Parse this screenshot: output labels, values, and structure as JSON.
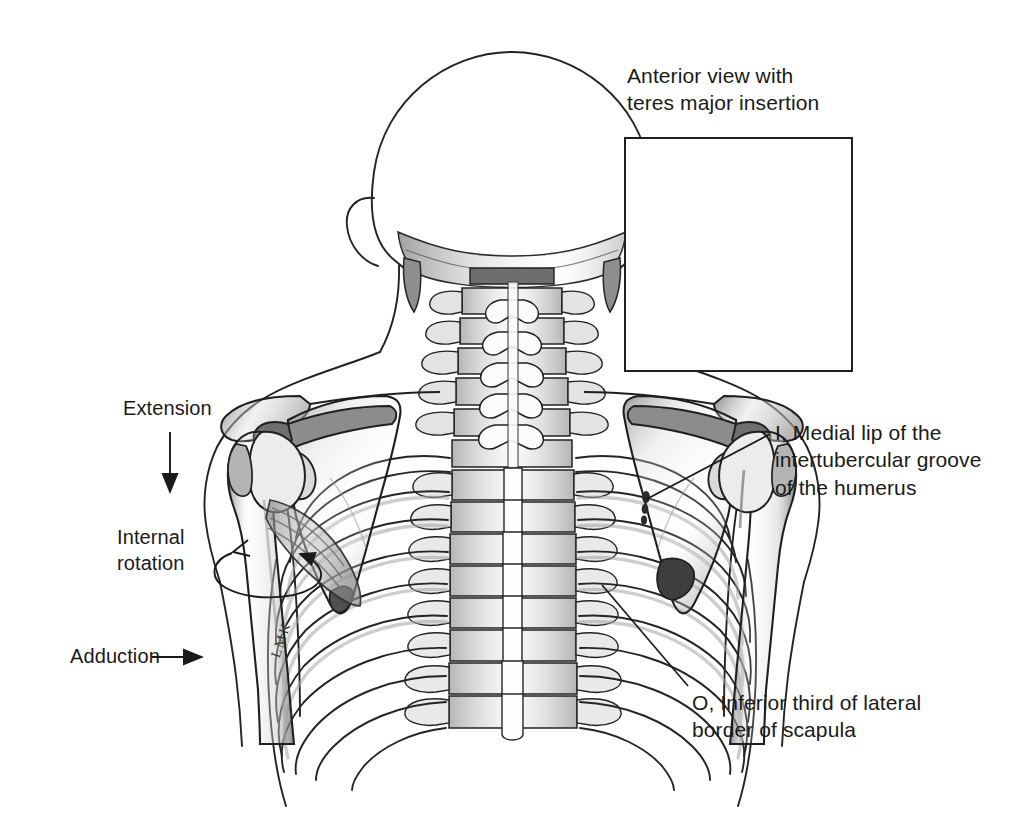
{
  "figure": {
    "kind": "anatomical-illustration",
    "background_color": "#ffffff",
    "ink_color": "#1a1a1a",
    "bone_fill": "#fdfdfd",
    "shade_tone": "#b9b9b9",
    "deep_shade_tone": "#6d6d6d"
  },
  "inset": {
    "title": "Anterior view with\nteres major insertion",
    "frame": {
      "x": 624,
      "y": 137,
      "width": 229,
      "height": 235,
      "border_color": "#1f1f1f"
    },
    "contents": "anterior shoulder: clavicle, scapula, coracoid process, humeral head, ribs"
  },
  "callouts": [
    {
      "id": "insertion",
      "code": "I",
      "text": "I, Medial lip of the\nintertubercular groove\nof the humerus",
      "label_x": 775,
      "label_y": 419,
      "leader_from": [
        770,
        434
      ],
      "leader_to": [
        645,
        500
      ]
    },
    {
      "id": "origin",
      "code": "O",
      "text": "O, Inferior third of lateral\nborder of scapula",
      "label_x": 692,
      "label_y": 689,
      "leader_from": [
        688,
        686
      ],
      "leader_to": [
        602,
        585
      ]
    }
  ],
  "motion_labels": [
    {
      "id": "extension",
      "text": "Extension",
      "label_x": 123,
      "label_y": 395,
      "arrow": "down",
      "arrow_path": {
        "x1": 170,
        "y1": 432,
        "x2": 170,
        "y2": 492
      }
    },
    {
      "id": "internal-rotation",
      "text": "Internal\nrotation",
      "label_x": 117,
      "label_y": 524,
      "arrow": "rotation-loop",
      "arrow_center": [
        272,
        565
      ]
    },
    {
      "id": "adduction",
      "text": "Adduction",
      "label_x": 70,
      "label_y": 643,
      "arrow": "right",
      "arrow_path": {
        "x1": 152,
        "y1": 657,
        "x2": 202,
        "y2": 657
      }
    }
  ],
  "signature": {
    "text": "LMK",
    "x": 268,
    "y": 655,
    "rotation_deg": -72
  },
  "anatomy_parts": [
    "skull (posterior)",
    "cervical vertebrae C1-C7",
    "thoracic vertebrae T1-T12",
    "lumbar vertebrae",
    "rib cage (12 pairs)",
    "left scapula",
    "right scapula",
    "left clavicle",
    "right clavicle",
    "left humerus",
    "right humerus",
    "teres major muscle",
    "body surface outline"
  ]
}
